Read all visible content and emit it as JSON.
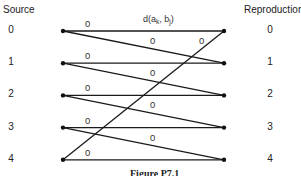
{
  "headers": {
    "source": "Source",
    "reproduction": "Reproduction"
  },
  "source_nodes": [
    "0",
    "1",
    "2",
    "3",
    "4"
  ],
  "reproduction_nodes": [
    "0",
    "1",
    "2",
    "3",
    "4"
  ],
  "distortion_label": "d(a_k, b_j)",
  "distortion_label_parts": {
    "d": "d(a",
    "k": "k",
    "sep": ", b",
    "j": "j",
    "close": ")"
  },
  "edges": [
    {
      "from": 0,
      "to": 0,
      "label": "0"
    },
    {
      "from": 0,
      "to": 1,
      "label": "0"
    },
    {
      "from": 1,
      "to": 1,
      "label": "0"
    },
    {
      "from": 1,
      "to": 2,
      "label": "0"
    },
    {
      "from": 2,
      "to": 2,
      "label": "0"
    },
    {
      "from": 2,
      "to": 3,
      "label": "0"
    },
    {
      "from": 3,
      "to": 3,
      "label": "0"
    },
    {
      "from": 3,
      "to": 4,
      "label": "0"
    },
    {
      "from": 4,
      "to": 4,
      "label": "0"
    },
    {
      "from": 4,
      "to": 0,
      "label": "0"
    }
  ],
  "caption": "Figure P7.1"
}
